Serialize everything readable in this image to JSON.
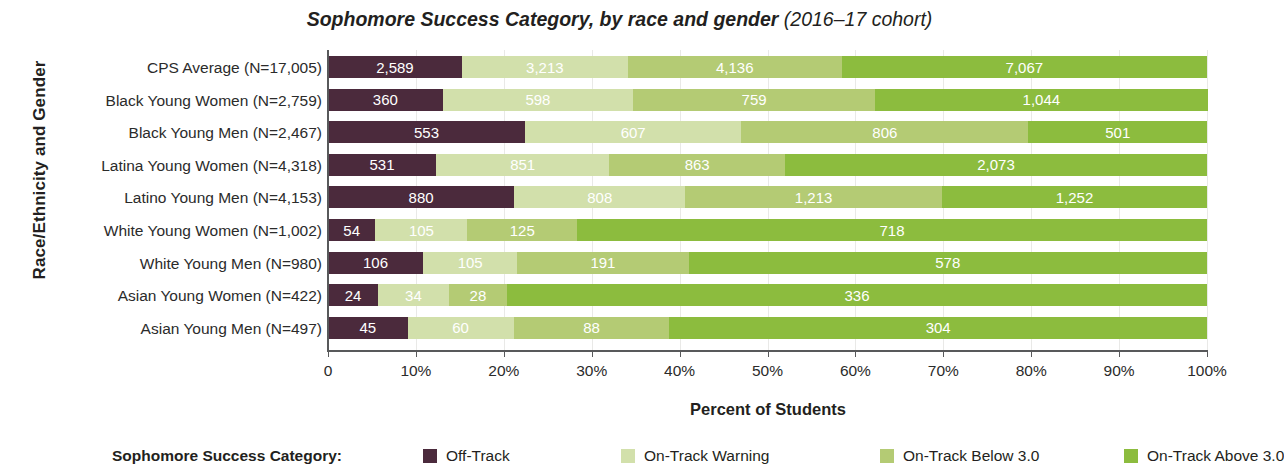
{
  "chart_data": {
    "type": "bar",
    "orientation": "horizontal",
    "stacked": true,
    "normalized": "percent",
    "title": "Sophomore Success Category, by race and gender (2016–17 cohort)",
    "title_main": "Sophomore Success Category, by race and gender",
    "title_sub": "(2016–17 cohort)",
    "xlabel": "Percent of Students",
    "ylabel": "Race/Ethnicity and Gender",
    "xlim": [
      0,
      100
    ],
    "xticks": [
      0,
      10,
      20,
      30,
      40,
      50,
      60,
      70,
      80,
      90,
      100
    ],
    "xtick_labels": [
      "0",
      "10%",
      "20%",
      "30%",
      "40%",
      "50%",
      "60%",
      "70%",
      "80%",
      "90%",
      "100%"
    ],
    "grid": true,
    "legend_position": "bottom",
    "legend_title": "Sophomore Success Category:",
    "series_names": [
      "Off-Track",
      "On-Track Warning",
      "On-Track Below 3.0",
      "On-Track Above 3.0"
    ],
    "series_colors": [
      "#4b2a3c",
      "#d2e0ab",
      "#b4cb74",
      "#8cbc3e"
    ],
    "categories": [
      "CPS Average (N=17,005)",
      "Black Young Women (N=2,759)",
      "Black Young Men (N=2,467)",
      "Latina Young Women (N=4,318)",
      "Latino Young Men (N=4,153)",
      "White Young Women (N=1,002)",
      "White Young Men (N=980)",
      "Asian Young Women (N=422)",
      "Asian Young Men (N=497)"
    ],
    "category_totals": [
      17005,
      2759,
      2467,
      4318,
      4153,
      1002,
      980,
      422,
      497
    ],
    "series": [
      {
        "name": "Off-Track",
        "values": [
          2589,
          360,
          553,
          531,
          880,
          54,
          106,
          24,
          45
        ]
      },
      {
        "name": "On-Track Warning",
        "values": [
          3213,
          598,
          607,
          851,
          808,
          105,
          105,
          34,
          60
        ]
      },
      {
        "name": "On-Track Below 3.0",
        "values": [
          4136,
          759,
          806,
          863,
          1213,
          125,
          191,
          28,
          88
        ]
      },
      {
        "name": "On-Track Above 3.0",
        "values": [
          7067,
          1044,
          501,
          2073,
          1252,
          718,
          578,
          336,
          304
        ]
      }
    ],
    "value_labels": [
      [
        "2,589",
        "3,213",
        "4,136",
        "7,067"
      ],
      [
        "360",
        "598",
        "759",
        "1,044"
      ],
      [
        "553",
        "607",
        "806",
        "501"
      ],
      [
        "531",
        "851",
        "863",
        "2,073"
      ],
      [
        "880",
        "808",
        "1,213",
        "1,252"
      ],
      [
        "54",
        "105",
        "125",
        "718"
      ],
      [
        "106",
        "105",
        "191",
        "578"
      ],
      [
        "24",
        "34",
        "28",
        "336"
      ],
      [
        "45",
        "60",
        "88",
        "304"
      ]
    ]
  }
}
